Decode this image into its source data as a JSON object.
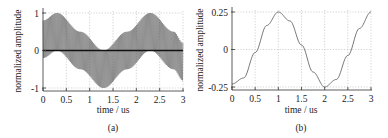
{
  "chart_data": [
    {
      "type": "line",
      "caption": "(a)",
      "title": "",
      "xlabel": "time / us",
      "ylabel": "normalized amplitude",
      "xlim": [
        0,
        3
      ],
      "ylim": [
        -1,
        1
      ],
      "xticks": [
        0,
        0.5,
        1,
        1.5,
        2,
        2.5,
        3
      ],
      "xtick_labels": [
        "0",
        "0.5",
        "1",
        "1.5",
        "2",
        "2.5",
        "3"
      ],
      "yticks": [
        -1,
        0,
        1
      ],
      "ytick_labels": [
        "-1",
        "0",
        "1"
      ],
      "grid": true,
      "series": [
        {
          "name": "modulated carrier",
          "description": "dense oscillation between an upper envelope and a lower envelope (upper minus 1)",
          "upper_envelope": {
            "x": [
              0,
              0.3,
              0.8,
              1.3,
              1.8,
              2.3,
              2.8,
              3.0
            ],
            "y": [
              0.8,
              1.0,
              0.5,
              0.0,
              0.5,
              1.0,
              0.5,
              0.2
            ]
          },
          "lower_envelope": {
            "x": [
              0,
              0.3,
              0.8,
              1.3,
              1.8,
              2.3,
              2.8,
              3.0
            ],
            "y": [
              -0.2,
              0.0,
              -0.5,
              -1.0,
              -0.5,
              0.0,
              -0.5,
              -0.8
            ]
          },
          "color": "#555555"
        },
        {
          "name": "baseline",
          "x": [
            0,
            3
          ],
          "y": [
            0,
            0
          ],
          "color": "#111111"
        }
      ]
    },
    {
      "type": "line",
      "caption": "(b)",
      "title": "",
      "xlabel": "time / us",
      "ylabel": "normalized amplitude",
      "xlim": [
        0,
        3
      ],
      "ylim": [
        -0.25,
        0.25
      ],
      "xticks": [
        0,
        0.5,
        1,
        1.5,
        2,
        2.5,
        3
      ],
      "xtick_labels": [
        "0",
        "0.5",
        "1",
        "1.5",
        "2",
        "2.5",
        "3"
      ],
      "yticks": [
        -0.25,
        0,
        0.25
      ],
      "ytick_labels": [
        "-0.25",
        "0",
        "0.25"
      ],
      "grid": true,
      "series": [
        {
          "name": "demodulated signal",
          "x": [
            0,
            0.25,
            0.5,
            0.75,
            1.0,
            1.25,
            1.5,
            1.75,
            2.0,
            2.25,
            2.5,
            2.75,
            3.0
          ],
          "y": [
            -0.23,
            -0.19,
            -0.02,
            0.16,
            0.25,
            0.19,
            0.03,
            -0.15,
            -0.25,
            -0.2,
            -0.04,
            0.14,
            0.25
          ],
          "color": "#555555"
        }
      ]
    }
  ]
}
